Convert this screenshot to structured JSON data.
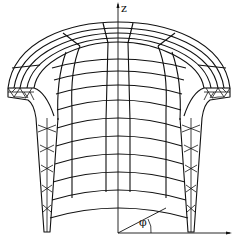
{
  "figure": {
    "axes": {
      "vertical_axis_label": "z",
      "angle_label": "φ"
    },
    "colors": {
      "line": "#111111",
      "background": "#ffffff"
    }
  }
}
